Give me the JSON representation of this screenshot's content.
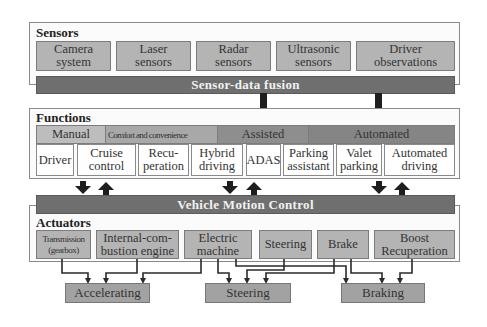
{
  "sensors": {
    "title": "Sensors",
    "items": [
      {
        "line1": "Camera",
        "line2": "system"
      },
      {
        "line1": "Laser",
        "line2": "sensors"
      },
      {
        "line1": "Radar",
        "line2": "sensors"
      },
      {
        "line1": "Ultrasonic",
        "line2": "sensors"
      },
      {
        "line1": "Driver",
        "line2": "observations"
      }
    ],
    "fusion_label": "Sensor-data fusion"
  },
  "functions": {
    "title": "Functions",
    "categories": [
      {
        "label": "Manual"
      },
      {
        "label": "Comfort and convenience"
      },
      {
        "label": "Assisted"
      },
      {
        "label": "Automated"
      }
    ],
    "items": [
      {
        "line1": "Driver",
        "line2": ""
      },
      {
        "line1": "Cruise",
        "line2": "control"
      },
      {
        "line1": "Recu-",
        "line2": "peration"
      },
      {
        "line1": "Hybrid",
        "line2": "driving"
      },
      {
        "line1": "ADAS",
        "line2": ""
      },
      {
        "line1": "Parking",
        "line2": "assistant"
      },
      {
        "line1": "Valet",
        "line2": "parking"
      },
      {
        "line1": "Automated",
        "line2": "driving"
      }
    ]
  },
  "vehicle_motion_control": {
    "label": "Vehicle Motion Control"
  },
  "actuators": {
    "title": "Actuators",
    "items": [
      {
        "line1": "Transmission",
        "line2": "(gearbox)"
      },
      {
        "line1": "Internal-com-",
        "line2": "bustion engine"
      },
      {
        "line1": "Electric",
        "line2": "machine"
      },
      {
        "line1": "Steering",
        "line2": ""
      },
      {
        "line1": "Brake",
        "line2": ""
      },
      {
        "line1": "Boost",
        "line2": "Recuperation"
      }
    ]
  },
  "outputs": [
    {
      "label": "Accelerating"
    },
    {
      "label": "Steering"
    },
    {
      "label": "Braking"
    }
  ],
  "colors": {
    "bar": "#6f6f6f",
    "box": "#b4b4b4",
    "output_box": "#a2a2a2",
    "arrow": "#1e1e1e"
  }
}
